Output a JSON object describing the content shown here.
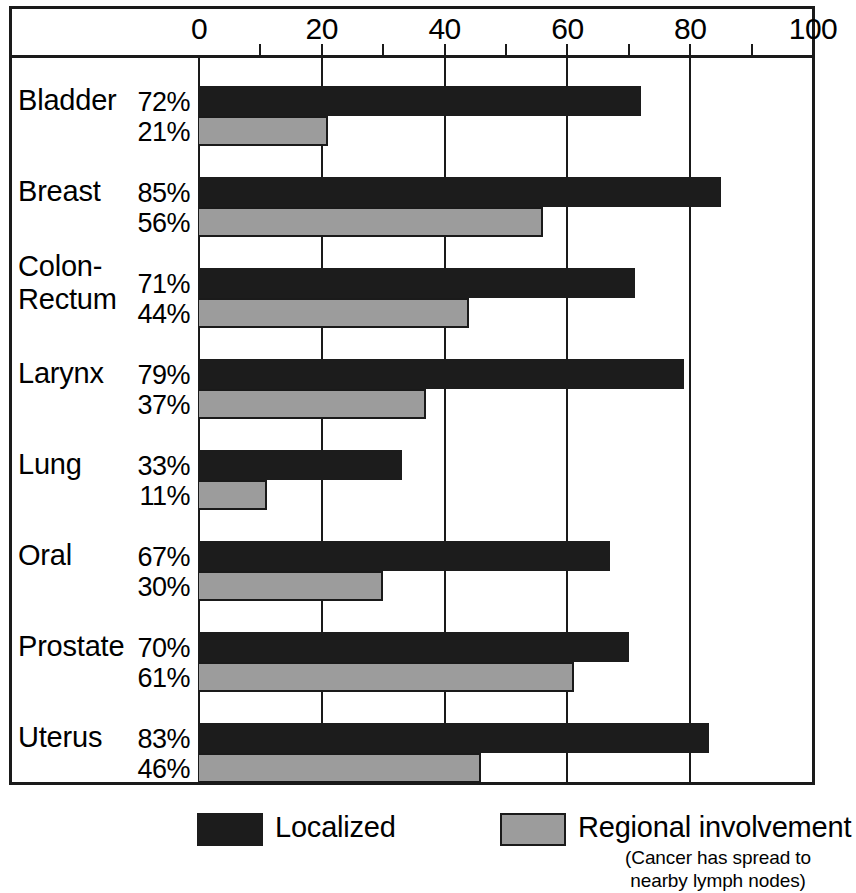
{
  "chart_data": {
    "type": "bar",
    "orientation": "horizontal",
    "title": "",
    "subtitle": "",
    "xlabel": "",
    "ylabel": "",
    "xlim": [
      0,
      100
    ],
    "ylim": null,
    "grid": true,
    "grid_axis": "x",
    "legend_position": "bottom",
    "categories": [
      "Bladder",
      "Breast",
      "Colon-\nRectum",
      "Larynx",
      "Lung",
      "Oral",
      "Prostate",
      "Uterus"
    ],
    "series": [
      {
        "name": "Localized",
        "color": "#1c1c1c",
        "values": [
          72,
          85,
          71,
          79,
          33,
          67,
          70,
          83
        ],
        "labels": [
          "72%",
          "85%",
          "71%",
          "79%",
          "33%",
          "67%",
          "70%",
          "83%"
        ]
      },
      {
        "name": "Regional involvement",
        "color": "#9c9c9c",
        "values": [
          21,
          56,
          44,
          37,
          11,
          30,
          61,
          46
        ],
        "labels": [
          "21%",
          "56%",
          "44%",
          "37%",
          "11%",
          "30%",
          "61%",
          "46%"
        ]
      }
    ],
    "x_major_ticks": [
      0,
      20,
      40,
      60,
      80,
      100
    ],
    "x_major_tick_labels": [
      "0",
      "20",
      "40",
      "60",
      "80",
      "100"
    ],
    "x_minor_ticks": [
      10,
      30,
      50,
      70,
      90
    ],
    "value_unit": "%"
  },
  "axis": {
    "ticks": [
      {
        "value": 0,
        "label": "0"
      },
      {
        "value": 20,
        "label": "20"
      },
      {
        "value": 40,
        "label": "40"
      },
      {
        "value": 60,
        "label": "60"
      },
      {
        "value": 80,
        "label": "80"
      },
      {
        "value": 100,
        "label": "100"
      }
    ],
    "minor_ticks": [
      10,
      30,
      50,
      70,
      90
    ],
    "gridlines": [
      0,
      20,
      40,
      60,
      80
    ]
  },
  "rows": [
    {
      "category": "Bladder",
      "localized": 72,
      "localized_label": "72%",
      "regional": 21,
      "regional_label": "21%"
    },
    {
      "category": "Breast",
      "localized": 85,
      "localized_label": "85%",
      "regional": 56,
      "regional_label": "56%"
    },
    {
      "category": "Colon-\nRectum",
      "localized": 71,
      "localized_label": "71%",
      "regional": 44,
      "regional_label": "44%"
    },
    {
      "category": "Larynx",
      "localized": 79,
      "localized_label": "79%",
      "regional": 37,
      "regional_label": "37%"
    },
    {
      "category": "Lung",
      "localized": 33,
      "localized_label": "33%",
      "regional": 11,
      "regional_label": "11%"
    },
    {
      "category": "Oral",
      "localized": 67,
      "localized_label": "67%",
      "regional": 30,
      "regional_label": "30%"
    },
    {
      "category": "Prostate",
      "localized": 70,
      "localized_label": "70%",
      "regional": 61,
      "regional_label": "61%"
    },
    {
      "category": "Uterus",
      "localized": 83,
      "localized_label": "83%",
      "regional": 46,
      "regional_label": "46%"
    }
  ],
  "legend": {
    "items": [
      {
        "label": "Localized",
        "sublabel": "",
        "color": "#1c1c1c",
        "outlined": false
      },
      {
        "label": "Regional involvement",
        "sublabel": "(Cancer has spread to\nnearby lymph nodes)",
        "color": "#9c9c9c",
        "outlined": true
      }
    ]
  },
  "colors": {
    "localized": "#1c1c1c",
    "regional": "#9c9c9c",
    "line": "#1a1a1a",
    "background": "#ffffff"
  }
}
